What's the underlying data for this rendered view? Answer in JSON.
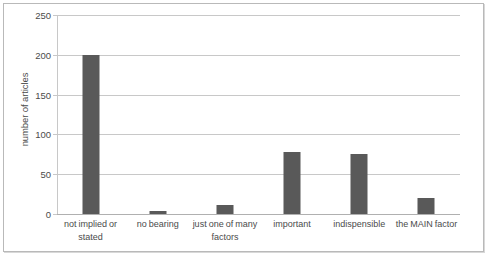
{
  "chart_data": {
    "type": "bar",
    "title": "",
    "xlabel": "",
    "ylabel": "number of articles",
    "categories": [
      "not implied or stated",
      "no bearing",
      "just one of many factors",
      "important",
      "indispensible",
      "the MAIN factor"
    ],
    "values": [
      200,
      4,
      11,
      78,
      76,
      20
    ],
    "ylim": [
      0,
      250
    ],
    "yticks": [
      0,
      50,
      100,
      150,
      200,
      250
    ],
    "ytick_labels": [
      "0",
      "50",
      "100",
      "150",
      "200",
      "250"
    ],
    "grid": true,
    "legend": "none",
    "bar_color": "#595959",
    "gridline_color": "#c8c8c8",
    "axis_text_color": "#4b4b4b",
    "plot_background": "#ffffff",
    "border_color": "#b9b9b9"
  }
}
